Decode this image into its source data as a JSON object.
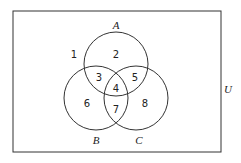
{
  "diagram": {
    "type": "venn",
    "universe_label": "U",
    "sets": [
      {
        "name": "A"
      },
      {
        "name": "B"
      },
      {
        "name": "C"
      }
    ],
    "regions": [
      {
        "id": "r1",
        "label": "1",
        "description": "outside A, B, C"
      },
      {
        "id": "r2",
        "label": "2",
        "description": "A only"
      },
      {
        "id": "r3",
        "label": "3",
        "description": "A and B only"
      },
      {
        "id": "r4",
        "label": "4",
        "description": "A, B and C"
      },
      {
        "id": "r5",
        "label": "5",
        "description": "A and C only"
      },
      {
        "id": "r6",
        "label": "6",
        "description": "B only"
      },
      {
        "id": "r7",
        "label": "7",
        "description": "B and C only"
      },
      {
        "id": "r8",
        "label": "8",
        "description": "C only"
      }
    ],
    "colors": {
      "stroke": "#333333",
      "text": "#222222",
      "background": "#ffffff"
    }
  }
}
